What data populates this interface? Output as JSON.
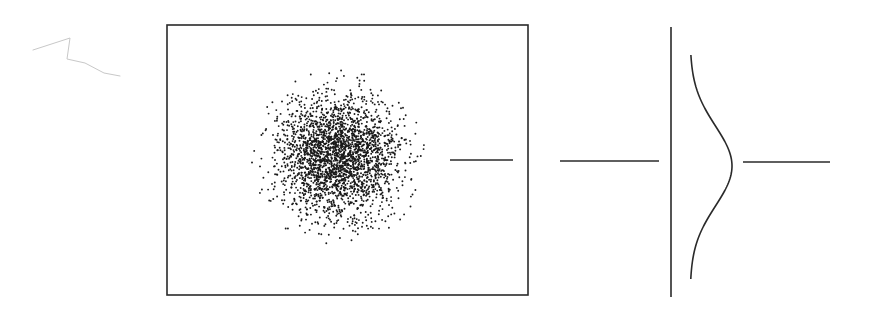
{
  "canvas": {
    "width": 872,
    "height": 311,
    "background": "#ffffff"
  },
  "colors": {
    "stroke": "#2a2a2a",
    "dots": "#1a1a1a",
    "pencil": "#c8c8c8"
  },
  "pencil_mark": {
    "points": [
      [
        33,
        50
      ],
      [
        70,
        38
      ],
      [
        67,
        59
      ],
      [
        85,
        63
      ],
      [
        104,
        73
      ],
      [
        120,
        76
      ]
    ]
  },
  "frame": {
    "x": 167,
    "y": 25,
    "width": 361,
    "height": 270,
    "stroke_width": 1.6
  },
  "scatter": {
    "center": [
      338,
      158
    ],
    "sigma_x": 30,
    "sigma_y": 30,
    "max_radius": 88,
    "count": 2600,
    "dot_radius": 0.95,
    "seed": 7
  },
  "inner_line": {
    "x1": 450,
    "x2": 513,
    "y": 160,
    "stroke_width": 1.3
  },
  "left_line": {
    "x1": 560,
    "x2": 659,
    "y": 161,
    "stroke_width": 1.3
  },
  "axis_line": {
    "x": 671,
    "y1": 27,
    "y2": 297,
    "stroke_width": 1.6
  },
  "gaussian_profile": {
    "base_x": 690,
    "peak_x": 732,
    "y_top": 55,
    "y_center": 166,
    "y_bottom": 280,
    "sigma": 40,
    "stroke_width": 1.6
  },
  "right_line": {
    "x1": 743,
    "x2": 830,
    "y": 162,
    "stroke_width": 1.3
  }
}
